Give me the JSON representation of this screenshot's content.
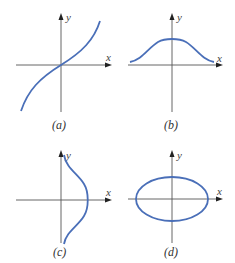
{
  "panels": [
    {
      "id": "a",
      "caption": "(a)",
      "x_label": "x",
      "y_label": "y",
      "curve": "odd increasing cubic-like curve through origin"
    },
    {
      "id": "b",
      "caption": "(b)",
      "x_label": "x",
      "y_label": "y",
      "curve": "bell-shaped curve above x-axis, symmetric about y-axis"
    },
    {
      "id": "c",
      "caption": "(c)",
      "x_label": "x",
      "y_label": "y",
      "curve": "sideways bell curve to the right of y-axis, symmetric about x-axis"
    },
    {
      "id": "d",
      "caption": "(d)",
      "x_label": "x",
      "y_label": "y",
      "curve": "ellipse centered at origin, wider than tall"
    }
  ],
  "colors": {
    "curve": "#4a6fb8",
    "axis": "#555555"
  }
}
